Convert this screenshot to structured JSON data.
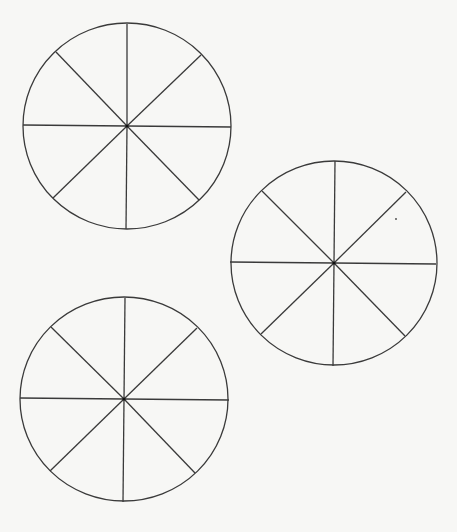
{
  "page": {
    "background": "#f7f7f5",
    "stroke_color": "#3a3a3a",
    "stroke_width": 1.3
  },
  "circles": [
    {
      "name": "circle-top-left",
      "cx": 127,
      "cy": 126,
      "rx": 104,
      "ry": 103,
      "segments": 8,
      "spokes": [
        [
          127,
          24
        ],
        [
          201,
          55
        ],
        [
          231,
          127
        ],
        [
          199,
          200
        ],
        [
          126,
          229
        ],
        [
          53,
          198
        ],
        [
          23,
          125
        ],
        [
          56,
          52
        ]
      ]
    },
    {
      "name": "circle-right",
      "cx": 334,
      "cy": 263,
      "rx": 103,
      "ry": 102,
      "segments": 8,
      "spokes": [
        [
          335,
          161
        ],
        [
          406,
          192
        ],
        [
          436,
          264
        ],
        [
          405,
          336
        ],
        [
          333,
          366
        ],
        [
          261,
          334
        ],
        [
          230,
          262
        ],
        [
          262,
          191
        ]
      ]
    },
    {
      "name": "circle-bottom-left",
      "cx": 124,
      "cy": 399,
      "rx": 104,
      "ry": 102,
      "segments": 8,
      "spokes": [
        [
          125,
          298
        ],
        [
          197,
          328
        ],
        [
          229,
          400
        ],
        [
          195,
          473
        ],
        [
          123,
          502
        ],
        [
          50,
          471
        ],
        [
          20,
          398
        ],
        [
          51,
          327
        ]
      ]
    }
  ]
}
